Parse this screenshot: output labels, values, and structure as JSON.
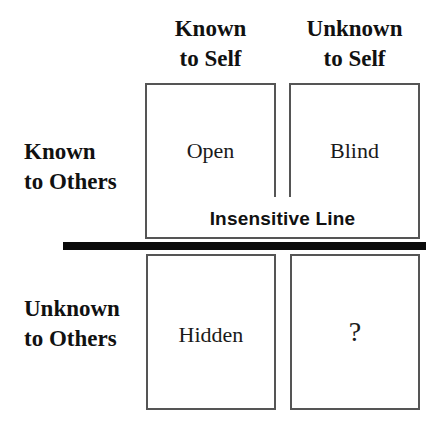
{
  "diagram": {
    "type": "johari-window",
    "columns": [
      {
        "line1": "Known",
        "line2": "to Self"
      },
      {
        "line1": "Unknown",
        "line2": "to Self"
      }
    ],
    "rows": [
      {
        "line1": "Known",
        "line2": "to Others"
      },
      {
        "line1": "Unknown",
        "line2": "to Others"
      }
    ],
    "quadrants": {
      "open": "Open",
      "blind": "Blind",
      "hidden": "Hidden",
      "unknown": "?"
    },
    "separator_label": "Insensitive Line",
    "colors": {
      "box_border": "#555555",
      "separator": "#0a0a0a",
      "text": "#111111",
      "background": "#ffffff"
    }
  }
}
